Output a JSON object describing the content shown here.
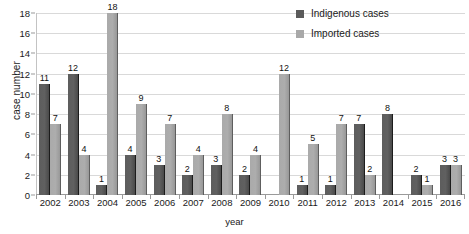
{
  "chart_data": {
    "type": "bar",
    "title": "",
    "xlabel": "year",
    "ylabel": "case number",
    "ylim": [
      0,
      18
    ],
    "yticks": [
      0,
      2,
      4,
      6,
      8,
      10,
      12,
      14,
      16,
      18
    ],
    "grid": true,
    "legend_position": "top-right",
    "categories": [
      "2002",
      "2003",
      "2004",
      "2005",
      "2006",
      "2007",
      "2008",
      "2009",
      "2010",
      "2011",
      "2012",
      "2013",
      "2014",
      "2015",
      "2016"
    ],
    "series": [
      {
        "name": "Indigenous cases",
        "color": "#5a5a5a",
        "values": [
          11,
          12,
          1,
          4,
          3,
          2,
          3,
          2,
          0,
          1,
          1,
          7,
          8,
          2,
          3
        ]
      },
      {
        "name": "Imported cases",
        "color": "#a8a8a8",
        "values": [
          7,
          4,
          18,
          9,
          7,
          4,
          8,
          4,
          12,
          5,
          7,
          2,
          0,
          1,
          3
        ]
      }
    ]
  }
}
